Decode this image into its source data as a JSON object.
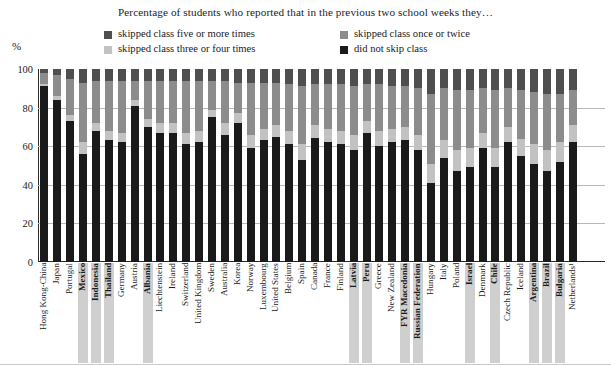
{
  "chart_data": {
    "type": "bar",
    "subtype": "stacked-column-100",
    "title": "Percentage of students who reported that in the previous two school weeks they…",
    "xlabel": "",
    "ylabel": "%",
    "ylim": [
      0,
      100
    ],
    "yticks": [
      0,
      20,
      40,
      60,
      80,
      100
    ],
    "grid": true,
    "legend_position": "top",
    "legend": [
      {
        "label": "skipped class five or more times",
        "color": "#4f4f4f"
      },
      {
        "label": "skipped class once or twice",
        "color": "#8c8c8c"
      },
      {
        "label": "skipped class three or four times",
        "color": "#c2c2c2"
      },
      {
        "label": "did not skip class",
        "color": "#1a1a1a"
      }
    ],
    "series": [
      {
        "name": "did not skip class",
        "color": "#1a1a1a",
        "values": [
          91,
          84,
          73,
          56,
          68,
          63,
          62,
          81,
          70,
          67,
          67,
          61,
          62,
          75,
          66,
          72,
          59,
          63,
          65,
          61,
          53,
          64,
          62,
          61,
          58,
          67,
          60,
          62,
          63,
          58,
          41,
          54,
          47,
          49,
          59,
          49,
          62,
          55,
          51,
          47,
          52,
          62,
          63,
          62
        ]
      },
      {
        "name": "skipped class three or four times",
        "color": "#c2c2c2",
        "values": [
          1,
          2,
          3,
          6,
          4,
          5,
          5,
          3,
          4,
          5,
          5,
          6,
          6,
          4,
          6,
          5,
          7,
          6,
          6,
          7,
          8,
          7,
          7,
          7,
          8,
          6,
          8,
          7,
          7,
          8,
          10,
          9,
          11,
          10,
          8,
          10,
          8,
          9,
          10,
          11,
          10,
          9,
          8,
          9
        ]
      },
      {
        "name": "skipped class once or twice",
        "color": "#8c8c8c",
        "values": [
          6,
          11,
          19,
          31,
          22,
          26,
          27,
          10,
          20,
          22,
          22,
          27,
          26,
          15,
          22,
          16,
          27,
          24,
          22,
          24,
          30,
          21,
          23,
          24,
          25,
          19,
          24,
          22,
          21,
          24,
          36,
          27,
          31,
          30,
          23,
          30,
          20,
          25,
          27,
          29,
          25,
          18,
          18,
          18
        ]
      },
      {
        "name": "skipped class five or more times",
        "color": "#4f4f4f",
        "values": [
          2,
          3,
          5,
          7,
          6,
          6,
          6,
          6,
          6,
          6,
          6,
          6,
          6,
          6,
          6,
          7,
          7,
          7,
          7,
          8,
          9,
          8,
          8,
          8,
          9,
          8,
          8,
          9,
          9,
          10,
          13,
          10,
          11,
          11,
          10,
          11,
          10,
          11,
          12,
          13,
          13,
          11,
          11,
          11
        ]
      }
    ],
    "categories": [
      {
        "label": "Hong Kong-China",
        "highlight": false
      },
      {
        "label": "Japan",
        "highlight": false
      },
      {
        "label": "Portugal",
        "highlight": false
      },
      {
        "label": "Mexico",
        "highlight": true
      },
      {
        "label": "Indonesia",
        "highlight": true
      },
      {
        "label": "Thailand",
        "highlight": true
      },
      {
        "label": "Germany",
        "highlight": false
      },
      {
        "label": "Austria",
        "highlight": false
      },
      {
        "label": "Albania",
        "highlight": true
      },
      {
        "label": "Liechtenstein",
        "highlight": false
      },
      {
        "label": "Ireland",
        "highlight": false
      },
      {
        "label": "Switzerland",
        "highlight": false
      },
      {
        "label": "United Kingdom",
        "highlight": false
      },
      {
        "label": "Sweden",
        "highlight": false
      },
      {
        "label": "Australia",
        "highlight": false
      },
      {
        "label": "Korea",
        "highlight": false
      },
      {
        "label": "Norway",
        "highlight": false
      },
      {
        "label": "Luxembourg",
        "highlight": false
      },
      {
        "label": "United States",
        "highlight": false
      },
      {
        "label": "Belgium",
        "highlight": false
      },
      {
        "label": "Spain",
        "highlight": false
      },
      {
        "label": "Canada",
        "highlight": false
      },
      {
        "label": "France",
        "highlight": false
      },
      {
        "label": "Finland",
        "highlight": false
      },
      {
        "label": "Latvia",
        "highlight": true
      },
      {
        "label": "Peru",
        "highlight": true
      },
      {
        "label": "Greece",
        "highlight": false
      },
      {
        "label": "New Zealand",
        "highlight": false
      },
      {
        "label": "FYR Macedonia",
        "highlight": true
      },
      {
        "label": "Russian Federation",
        "highlight": true
      },
      {
        "label": "Hungary",
        "highlight": false
      },
      {
        "label": "Italy",
        "highlight": false
      },
      {
        "label": "Poland",
        "highlight": false
      },
      {
        "label": "Israel",
        "highlight": true
      },
      {
        "label": "Denmark",
        "highlight": false
      },
      {
        "label": "Chile",
        "highlight": true
      },
      {
        "label": "Czech Republic",
        "highlight": false
      },
      {
        "label": "Iceland",
        "highlight": false
      },
      {
        "label": "Argentina",
        "highlight": true
      },
      {
        "label": "Brazil",
        "highlight": true
      },
      {
        "label": "Bulgaria",
        "highlight": true
      },
      {
        "label": "Netherlands¹",
        "highlight": false
      },
      {
        "label": "",
        "highlight": false
      },
      {
        "label": "",
        "highlight": false
      }
    ]
  }
}
